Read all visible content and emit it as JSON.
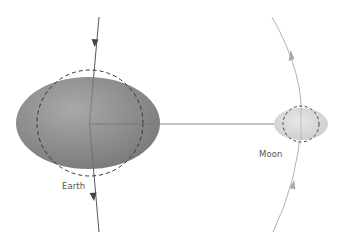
{
  "diagram": {
    "labels": {
      "earth": "Earth",
      "moon": "Moon"
    },
    "colors": {
      "background": "#ffffff",
      "earth_fill_light": "#a8a8a8",
      "earth_fill_dark": "#7a7a7a",
      "moon_fill_light": "#e2e2e2",
      "moon_fill_dark": "#cfcfcf",
      "dashed_outline": "#333333",
      "earth_path": "#555555",
      "moon_orbit": "#b0b0b0",
      "connector": "#777777",
      "label_text": "#555555"
    }
  }
}
